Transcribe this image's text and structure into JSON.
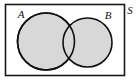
{
  "figure": {
    "type": "venn-diagram",
    "background_color": "#ffffff"
  },
  "universal_set": {
    "label": "S",
    "label_x": 130,
    "label_y": 13,
    "rect": {
      "x": 5.5,
      "y": 4.5,
      "width": 119,
      "height": 71
    },
    "stroke_color": "#1a1a1a",
    "stroke_width": 1.6,
    "fill_color": "#ffffff"
  },
  "sets": [
    {
      "label": "A",
      "label_x": 21,
      "label_y": 18,
      "cx": 46,
      "cy": 41.5,
      "r": 28.5,
      "fill_color": "#d8d8d8",
      "stroke_color": "#111111",
      "stroke_width": 1.6
    },
    {
      "label": "B",
      "label_x": 108,
      "label_y": 19,
      "cx": 87.5,
      "cy": 42.5,
      "r": 24.5,
      "fill_color": "#d8d8d8",
      "stroke_color": "#111111",
      "stroke_width": 1.6
    }
  ],
  "labels": {
    "a": "A",
    "b": "B",
    "s": "S"
  }
}
